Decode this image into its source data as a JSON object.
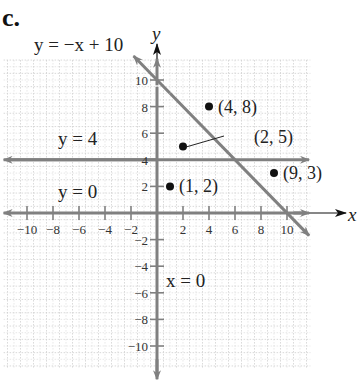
{
  "figure": {
    "part_label": "c.",
    "axis_labels": {
      "x": "x",
      "y": "y"
    },
    "colors": {
      "line": "#808080",
      "axis_arrow": "#111111",
      "grid": "#c8c8c8",
      "point": "#111111",
      "text": "#222222"
    },
    "equations": {
      "diagonal": "y = −x + 10",
      "horizontal_4": "y = 4",
      "x_axis": "y = 0",
      "y_axis": "x = 0"
    }
  },
  "chart_data": {
    "type": "scatter",
    "title": "",
    "xlabel": "x",
    "ylabel": "y",
    "xlim": [
      -11.5,
      11.5
    ],
    "ylim": [
      -11.5,
      11.5
    ],
    "grid": true,
    "x_ticks": [
      -10,
      -8,
      -6,
      -4,
      -2,
      2,
      4,
      6,
      8,
      10
    ],
    "x_tick_labels": [
      "−10",
      "−8",
      "−6",
      "−4",
      "−2",
      "2",
      "4",
      "6",
      "8",
      "10"
    ],
    "y_ticks": [
      -10,
      -8,
      -6,
      -4,
      -2,
      2,
      4,
      6,
      8,
      10
    ],
    "y_tick_labels": [
      "−10",
      "−8",
      "−6",
      "−4",
      "−2",
      "2",
      "4",
      "6",
      "8",
      "10"
    ],
    "points": [
      {
        "x": 4,
        "y": 8,
        "label": "(4, 8)"
      },
      {
        "x": 2,
        "y": 5,
        "label": "(2, 5)"
      },
      {
        "x": 1,
        "y": 2,
        "label": "(1, 2)"
      },
      {
        "x": 9,
        "y": 3,
        "label": "(9, 3)"
      }
    ],
    "lines": [
      {
        "equation": "y = −x + 10",
        "slope": -1,
        "intercept": 10
      },
      {
        "equation": "y = 4",
        "slope": 0,
        "intercept": 4
      },
      {
        "equation": "y = 0",
        "slope": 0,
        "intercept": 0
      },
      {
        "equation": "x = 0",
        "vertical": true,
        "x": 0
      }
    ]
  }
}
